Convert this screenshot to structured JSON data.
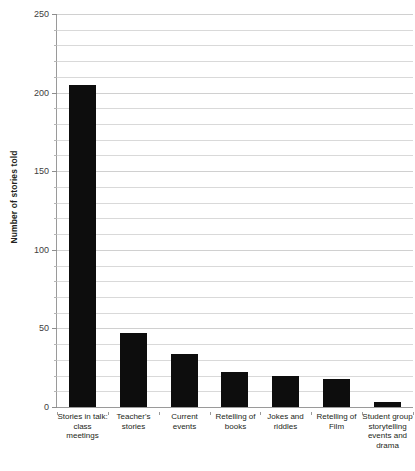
{
  "chart_data": {
    "type": "bar",
    "title": "Number of stories told in classroom",
    "xlabel": "",
    "ylabel": "Number of stories told",
    "ylim": [
      0,
      250
    ],
    "ytick_labels": [
      "0",
      "50",
      "100",
      "150",
      "200",
      "250"
    ],
    "ytick_values": [
      0,
      50,
      100,
      150,
      200,
      250
    ],
    "grid": true,
    "grid_interval": 10,
    "legend": "none",
    "bar_color": "#0d0d0d",
    "background_color": "#ffffff",
    "gridline_color": "#d9d9d9",
    "categories": [
      "Stories in talk: class meetings",
      "Teacher's stories",
      "Current events",
      "Retelling of books",
      "Jokes and riddles",
      "Retelling of Film",
      "Student group storytelling events and drama"
    ],
    "values": [
      205,
      47,
      34,
      22,
      20,
      18,
      3
    ]
  }
}
